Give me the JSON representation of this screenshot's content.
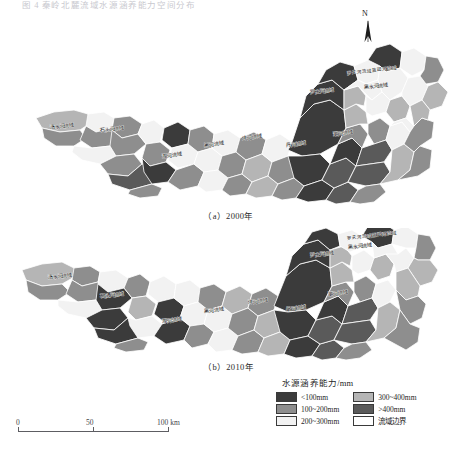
{
  "figure": {
    "top_caption": "图 4  秦岭北麓流域水源涵养能力空间分布",
    "north_label": "N"
  },
  "panels": [
    {
      "id": "a",
      "caption": "（a）2000年",
      "year": "2000"
    },
    {
      "id": "b",
      "caption": "（b）2010年",
      "year": "2010"
    }
  ],
  "scalebar": {
    "ticks": [
      "0",
      "50",
      "100 km"
    ],
    "unit": "km"
  },
  "legend": {
    "title": "水源涵养能力/mm",
    "column1": [
      {
        "label": "<100mm",
        "color": "#3b3b3b"
      },
      {
        "label": "100~200mm",
        "color": "#8e8e8e"
      },
      {
        "label": "200~300mm",
        "color": "#f2f2f2"
      }
    ],
    "column2": [
      {
        "label": "300~400mm",
        "color": "#b5b5b5"
      },
      {
        "label": ">400mm",
        "color": "#5a5a5a"
      },
      {
        "label": "流域边界",
        "color": "#ffffff"
      }
    ]
  },
  "chart_data": {
    "type": "heatmap",
    "title": "秦岭北麓流域水源涵养能力空间分布",
    "subtitle": "",
    "xlabel": "",
    "ylabel": "",
    "legend_position": "bottom-right",
    "grid": false,
    "value_unit": "mm",
    "classes": [
      {
        "name": "<100mm",
        "color": "#3b3b3b",
        "range": [
          0,
          100
        ]
      },
      {
        "name": "100~200mm",
        "color": "#8e8e8e",
        "range": [
          100,
          200
        ]
      },
      {
        "name": "200~300mm",
        "color": "#f2f2f2",
        "range": [
          200,
          300
        ]
      },
      {
        "name": "300~400mm",
        "color": "#b5b5b5",
        "range": [
          300,
          400
        ]
      },
      {
        "name": ">400mm",
        "color": "#5a5a5a",
        "range": [
          400,
          600
        ]
      }
    ],
    "panels": [
      {
        "id": "a",
        "label": "（a）2000年",
        "year": 2000,
        "basins": [
          {
            "name": "湑水河流域",
            "class": "100~200mm"
          },
          {
            "name": "石头河流域",
            "class": "100~200mm"
          },
          {
            "name": "湘河流域",
            "class": "<100mm"
          },
          {
            "name": "黑河流域",
            "class": "200~300mm"
          },
          {
            "name": "沣河流域",
            "class": "300~400mm"
          },
          {
            "name": "丹河流域",
            "class": "<100mm"
          },
          {
            "name": "罗夫河流域",
            "class": ">400mm"
          },
          {
            "name": "黑水河流域",
            "class": "200~300mm"
          },
          {
            "name": "灞河流域",
            "class": "<100mm"
          },
          {
            "name": "罗夫河流域蓝田河流域",
            "class": "200~300mm"
          }
        ]
      },
      {
        "id": "b",
        "label": "（b）2010年",
        "year": 2010,
        "basins": [
          {
            "name": "湑水河流域",
            "class": "100~200mm"
          },
          {
            "name": "石头河流域",
            "class": "<100mm"
          },
          {
            "name": "湘河流域",
            "class": "<100mm"
          },
          {
            "name": "黑河流域",
            "class": "100~200mm"
          },
          {
            "name": "沣河流域",
            "class": "100~200mm"
          },
          {
            "name": "丹河流域",
            "class": "300~400mm"
          },
          {
            "name": "罗夫河流域",
            "class": ">400mm"
          },
          {
            "name": "黑水河流域",
            "class": "100~200mm"
          },
          {
            "name": "灞河流域",
            "class": "<100mm"
          },
          {
            "name": "罗夫河流域蓝田河流域",
            "class": "200~300mm"
          }
        ]
      }
    ]
  },
  "map_labels": {
    "a": [
      {
        "text": "湑水河流域",
        "x": 62,
        "y": 128,
        "rot": -6
      },
      {
        "text": "石头河流域",
        "x": 112,
        "y": 131,
        "rot": -6
      },
      {
        "text": "湘河流域",
        "x": 172,
        "y": 157,
        "rot": -6
      },
      {
        "text": "黑河流域",
        "x": 214,
        "y": 146,
        "rot": -6
      },
      {
        "text": "沣河流域",
        "x": 252,
        "y": 139,
        "rot": -6
      },
      {
        "text": "丹河流域",
        "x": 296,
        "y": 146,
        "rot": -6
      },
      {
        "text": "罗夫河流域",
        "x": 322,
        "y": 93,
        "rot": -6
      },
      {
        "text": "黑水河流域",
        "x": 376,
        "y": 88,
        "rot": -6
      },
      {
        "text": "灞河流域",
        "x": 343,
        "y": 135,
        "rot": -6
      },
      {
        "text": "罗夫河流域蓝田河流域",
        "x": 372,
        "y": 72,
        "rot": -6
      }
    ],
    "b": [
      {
        "text": "湑水河流域",
        "x": 60,
        "y": 278,
        "rot": -6
      },
      {
        "text": "石头河流域",
        "x": 112,
        "y": 297,
        "rot": -6
      },
      {
        "text": "湘河流域",
        "x": 172,
        "y": 322,
        "rot": -6
      },
      {
        "text": "黑河流域",
        "x": 214,
        "y": 312,
        "rot": -6
      },
      {
        "text": "沣河流域",
        "x": 258,
        "y": 303,
        "rot": -6
      },
      {
        "text": "丹河流域",
        "x": 296,
        "y": 310,
        "rot": -6
      },
      {
        "text": "罗夫河流域",
        "x": 322,
        "y": 256,
        "rot": -6
      },
      {
        "text": "黑水河流域",
        "x": 360,
        "y": 248,
        "rot": -6
      },
      {
        "text": "灞河流域",
        "x": 338,
        "y": 295,
        "rot": -6
      },
      {
        "text": "罗夫河流域蓝田河流域",
        "x": 372,
        "y": 237,
        "rot": -6
      }
    ]
  }
}
